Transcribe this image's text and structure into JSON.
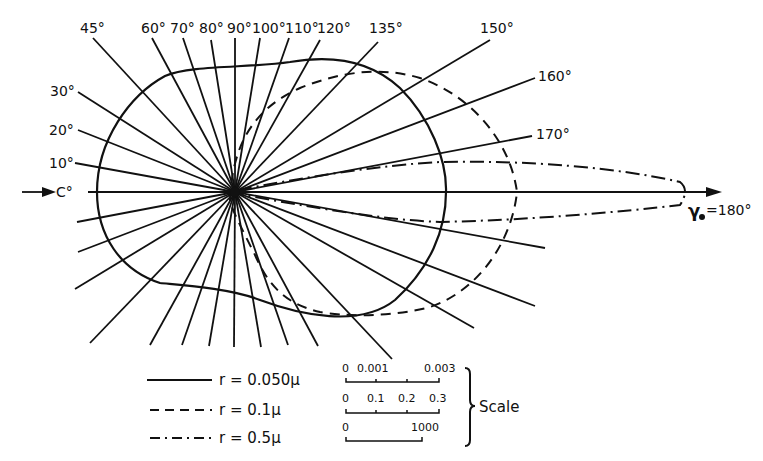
{
  "diagram": {
    "type": "polar scattering diagram",
    "center": [
      235,
      192
    ],
    "incident_label": "0°",
    "incident_label_display": "C°",
    "forward_label": "γ₀=180°",
    "forward_symbol": "γ",
    "forward_value": "=180°",
    "angle_labels": [
      {
        "angle": 10,
        "text": "10°"
      },
      {
        "angle": 20,
        "text": "20°"
      },
      {
        "angle": 30,
        "text": "30°"
      },
      {
        "angle": 45,
        "text": "45°"
      },
      {
        "angle": 60,
        "text": "60°"
      },
      {
        "angle": 70,
        "text": "70°"
      },
      {
        "angle": 80,
        "text": "80°"
      },
      {
        "angle": 90,
        "text": "90°"
      },
      {
        "angle": 100,
        "text": "100°"
      },
      {
        "angle": 110,
        "text": "110°"
      },
      {
        "angle": 120,
        "text": "120°"
      },
      {
        "angle": 135,
        "text": "135°"
      },
      {
        "angle": 150,
        "text": "150°"
      },
      {
        "angle": 160,
        "text": "160°"
      },
      {
        "angle": 170,
        "text": "170°"
      }
    ]
  },
  "legend": {
    "items": [
      {
        "style": "solid",
        "label": "r = 0.050μ"
      },
      {
        "style": "dashed",
        "label": "r = 0.1μ"
      },
      {
        "style": "dash-dot",
        "label": "r = 0.5μ"
      }
    ]
  },
  "scale": {
    "title": "Scale",
    "bars": [
      {
        "ticks": [
          "0",
          "0.001",
          "0.003"
        ]
      },
      {
        "ticks": [
          "0",
          "0.1",
          "0.2",
          "0.3"
        ]
      },
      {
        "ticks": [
          "0",
          "1000"
        ]
      }
    ]
  }
}
